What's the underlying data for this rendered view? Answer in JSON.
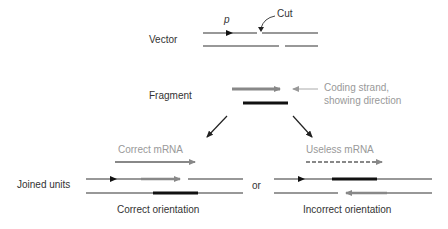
{
  "labels": {
    "vector": "Vector",
    "promoter": "p",
    "cut": "Cut",
    "fragment": "Fragment",
    "coding_strand_line1": "Coding strand,",
    "coding_strand_line2": "showing direction",
    "correct_mrna": "Correct mRNA",
    "useless_mrna": "Useless mRNA",
    "joined_units": "Joined units",
    "or": "or",
    "correct_orientation": "Correct orientation",
    "incorrect_orientation": "Incorrect orientation"
  },
  "colors": {
    "dna_line": "#333333",
    "coding_strand": "#888888",
    "template_strand": "#111111",
    "label_gray": "#999999",
    "label_dark": "#333333"
  }
}
